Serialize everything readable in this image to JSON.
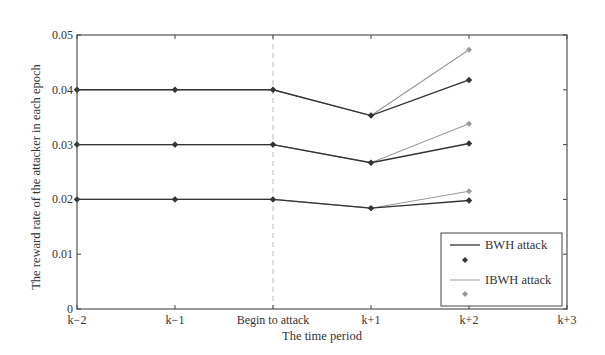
{
  "chart_data": {
    "type": "line",
    "title": "",
    "xlabel": "The time period",
    "ylabel": "The reward rate of the attacker in each epoch",
    "categories": [
      "k−2",
      "k−1",
      "Begin to attack",
      "k+1",
      "k+2",
      "k+3"
    ],
    "ylim": [
      0,
      0.05
    ],
    "yticks": [
      "0",
      "0.01",
      "0.02",
      "0.03",
      "0.04",
      "0.05"
    ],
    "grid": false,
    "legend_position": "lower right",
    "annotations": [
      {
        "type": "vertical-dashed-line",
        "at": "Begin to attack"
      }
    ],
    "series": [
      {
        "name": "BWH attack (high)",
        "group": "BWH attack",
        "values": [
          0.04,
          0.04,
          0.04,
          0.0353,
          0.0418,
          null
        ]
      },
      {
        "name": "BWH attack (mid)",
        "group": "BWH attack",
        "values": [
          0.03,
          0.03,
          0.03,
          0.0267,
          0.0302,
          null
        ]
      },
      {
        "name": "BWH attack (low)",
        "group": "BWH attack",
        "values": [
          0.02,
          0.02,
          0.02,
          0.0184,
          0.0198,
          null
        ]
      },
      {
        "name": "IBWH attack (high)",
        "group": "IBWH attack",
        "values": [
          0.04,
          0.04,
          0.04,
          0.0353,
          0.0473,
          null
        ]
      },
      {
        "name": "IBWH attack (mid)",
        "group": "IBWH attack",
        "values": [
          0.03,
          0.03,
          0.03,
          0.0267,
          0.0338,
          null
        ]
      },
      {
        "name": "IBWH attack (low)",
        "group": "IBWH attack",
        "values": [
          0.02,
          0.02,
          0.02,
          0.0184,
          0.0215,
          null
        ]
      }
    ]
  },
  "legend": {
    "items": [
      {
        "label": "BWH attack",
        "color": "#333333"
      },
      {
        "label": "IBWH attack",
        "color": "#999999"
      }
    ]
  },
  "colors": {
    "bwh": "#333333",
    "ibwh": "#9a9a9a",
    "axis": "#444444",
    "dashed": "#bbbbbb"
  }
}
